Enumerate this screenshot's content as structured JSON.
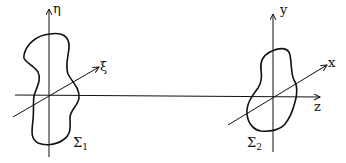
{
  "diagram": {
    "left_frame": {
      "axis_vertical_label": "η",
      "axis_oblique_label": "ξ",
      "region_label": "Σ",
      "region_subscript": "1"
    },
    "right_frame": {
      "axis_vertical_label": "y",
      "axis_oblique_label": "x",
      "axis_horizontal_label": "z",
      "region_label": "Σ",
      "region_subscript": "2"
    },
    "colors": {
      "stroke": "#111111",
      "background": "#ffffff"
    }
  }
}
